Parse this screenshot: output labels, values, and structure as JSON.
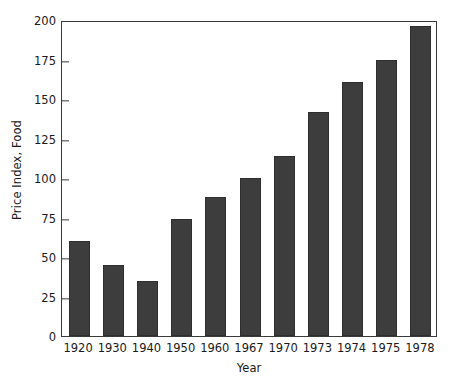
{
  "chart_data": {
    "type": "bar",
    "title": "",
    "subtitle": "",
    "xlabel": "Year",
    "ylabel": "Price Index, Food",
    "categories": [
      "1920",
      "1930",
      "1940",
      "1950",
      "1960",
      "1967",
      "1970",
      "1973",
      "1974",
      "1975",
      "1978"
    ],
    "values": [
      60,
      45,
      35,
      74,
      88,
      100,
      114,
      142,
      161,
      175,
      196
    ],
    "series": [
      {
        "name": "Price Index, Food",
        "values": [
          60,
          45,
          35,
          74,
          88,
          100,
          114,
          142,
          161,
          175,
          196
        ]
      }
    ],
    "ylim": [
      0,
      200
    ],
    "yticks": [
      0,
      25,
      50,
      75,
      100,
      125,
      150,
      175,
      200
    ],
    "ytick_labels": [
      "0",
      "25",
      "50",
      "75",
      "100",
      "125",
      "150",
      "175",
      "200"
    ],
    "grid": false,
    "legend": null,
    "legend_position": "none",
    "bar_color": "#3d3d3d",
    "axis_color": "#3a3a3a",
    "background_color": "#ffffff",
    "annotations": []
  }
}
